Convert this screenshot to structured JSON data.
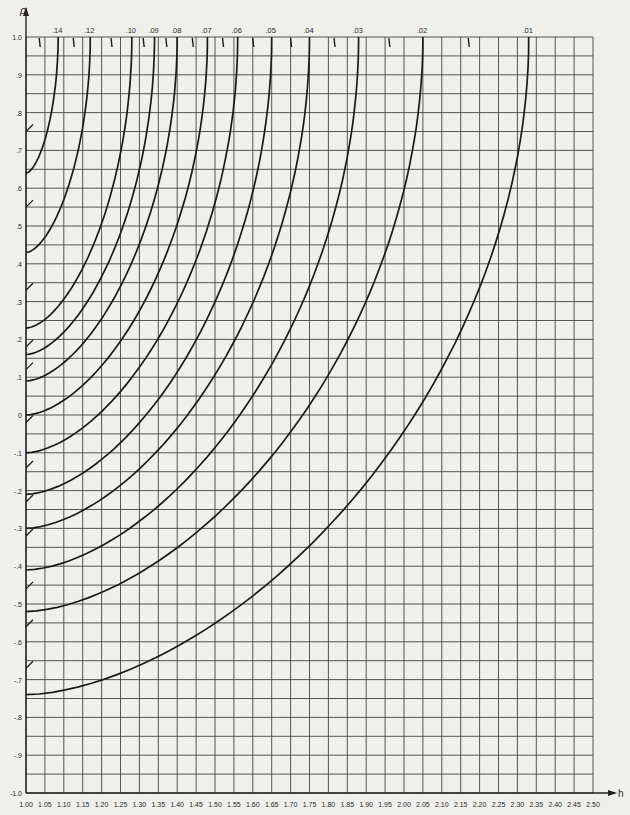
{
  "chart_data": {
    "type": "line",
    "title": "",
    "xlabel": "h",
    "ylabel": "ρ",
    "xlim": [
      1.0,
      2.5
    ],
    "ylim": [
      -1.0,
      1.0
    ],
    "grid": true,
    "x_ticks": [
      "1.00",
      "1.05",
      "1.10",
      "1.15",
      "1.20",
      "1.25",
      "1.30",
      "1.35",
      "1.40",
      "1.45",
      "1.50",
      "1.55",
      "1.60",
      "1.65",
      "1.70",
      "1.75",
      "1.80",
      "1.85",
      "1.90",
      "1.95",
      "2.00",
      "2.05",
      "2.10",
      "2.15",
      "2.20",
      "2.25",
      "2.30",
      "2.35",
      "2.40",
      "2.45",
      "2.50"
    ],
    "y_ticks": [
      "1.0",
      ".9",
      ".8",
      ".7",
      ".6",
      ".5",
      ".4",
      ".3",
      ".2",
      ".1",
      "0",
      "-.1",
      "-.2",
      "-.3",
      "-.4",
      "-.5",
      "-.6",
      "-.7",
      "-.8",
      "-.9",
      "-1.0"
    ],
    "series": [
      {
        "name": ".14",
        "top_h": 1.085,
        "rho_at_h1": 0.64
      },
      {
        "name": ".12",
        "top_h": 1.17,
        "rho_at_h1": 0.43
      },
      {
        "name": ".10",
        "top_h": 1.28,
        "rho_at_h1": 0.23
      },
      {
        "name": ".09",
        "top_h": 1.34,
        "rho_at_h1": 0.16
      },
      {
        "name": ".08",
        "top_h": 1.4,
        "rho_at_h1": 0.09
      },
      {
        "name": ".07",
        "top_h": 1.48,
        "rho_at_h1": 0.0
      },
      {
        "name": ".06",
        "top_h": 1.56,
        "rho_at_h1": -0.1
      },
      {
        "name": ".05",
        "top_h": 1.65,
        "rho_at_h1": -0.21
      },
      {
        "name": ".04",
        "top_h": 1.75,
        "rho_at_h1": -0.3
      },
      {
        "name": ".03",
        "top_h": 1.88,
        "rho_at_h1": -0.41
      },
      {
        "name": ".02",
        "top_h": 2.05,
        "rho_at_h1": -0.52
      },
      {
        "name": ".01",
        "top_h": 2.33,
        "rho_at_h1": -0.74
      }
    ],
    "curve_labels": [
      ".14",
      ".12",
      ".10",
      ".09",
      ".08",
      ".07",
      ".06",
      ".05",
      ".04",
      ".03",
      ".02",
      ".01"
    ],
    "minor_tick_h": [
      1.035,
      1.125,
      1.225,
      1.31,
      1.37,
      1.44,
      1.52,
      1.6,
      1.7,
      1.815,
      1.96,
      2.17
    ]
  }
}
